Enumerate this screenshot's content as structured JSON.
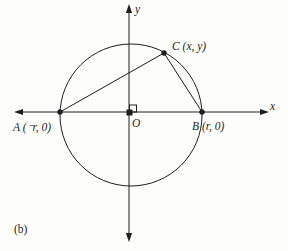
{
  "colors": {
    "ink": "#1e1e1e",
    "paper": "#fdfdfc"
  },
  "figure": {
    "caption": "(b)",
    "x_axis_label": "x",
    "y_axis_label": "y",
    "origin_label": "O",
    "point_a_label": "A (⁻r, 0)",
    "point_b_label": "B (r, 0)",
    "point_c_label": "C (x, y)"
  }
}
